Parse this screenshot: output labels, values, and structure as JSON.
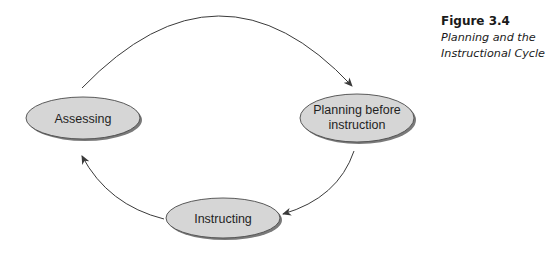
{
  "figure": {
    "number": "Figure 3.4",
    "title": "Planning and the Instructional Cycle"
  },
  "colors": {
    "node_fill": "#d6d6d6",
    "node_stroke": "#4a4a4a",
    "node_shadow": "#7a7a7a",
    "arrow": "#3a3a3a",
    "text": "#1f1f1f"
  },
  "nodes": [
    {
      "id": "assessing",
      "lines": [
        "Assessing"
      ]
    },
    {
      "id": "planning",
      "lines": [
        "Planning before",
        "instruction"
      ]
    },
    {
      "id": "instructing",
      "lines": [
        "Instructing"
      ]
    }
  ],
  "edges": [
    {
      "from": "assessing",
      "to": "planning"
    },
    {
      "from": "planning",
      "to": "instructing"
    },
    {
      "from": "instructing",
      "to": "assessing"
    }
  ]
}
